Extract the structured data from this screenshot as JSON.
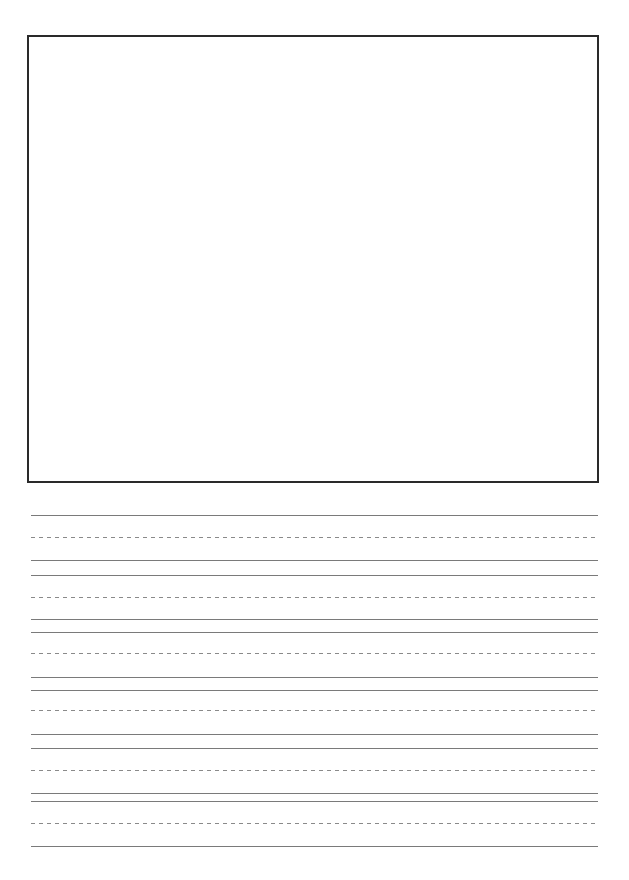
{
  "page": {
    "type": "primary writing paper",
    "drawing_box": {
      "label": ""
    },
    "writing_lines": [
      {
        "top": 515,
        "mid": 537,
        "base": 560
      },
      {
        "top": 575,
        "mid": 597,
        "base": 619
      },
      {
        "top": 632,
        "mid": 653,
        "base": 677
      },
      {
        "top": 690,
        "mid": 710,
        "base": 734
      },
      {
        "top": 748,
        "mid": 770,
        "base": 793
      },
      {
        "top": 801,
        "mid": 823,
        "base": 846
      }
    ],
    "colors": {
      "box_border": "#2a2a2a",
      "solid_line": "#7a7a7a",
      "dashed_line": "#8a8a8a"
    }
  }
}
